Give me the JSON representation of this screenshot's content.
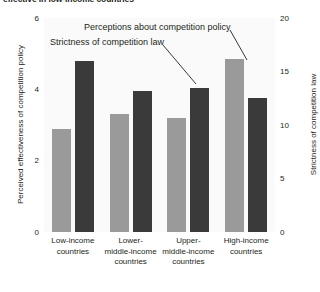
{
  "chart_data": {
    "type": "bar",
    "title": "effective in low-income countries",
    "categories": [
      "Low-income\ncountries",
      "Lower-\nmiddle-income\ncountries",
      "Upper-\nmiddle-income\ncountries",
      "High-income\ncountries"
    ],
    "series": [
      {
        "name": "Perceptions about competition policy",
        "axis": "left",
        "color": "#9a9a9a",
        "values": [
          2.9,
          3.3,
          3.2,
          4.85
        ]
      },
      {
        "name": "Strictness of competition law",
        "axis": "right",
        "color": "#3a3a3a",
        "values": [
          16.0,
          13.2,
          13.5,
          12.5
        ]
      }
    ],
    "xlabel": "",
    "ylabel": "Perceived effectiveness of competition policy",
    "ylabel_right": "Strictness of competition law",
    "ylim": [
      0,
      6
    ],
    "ylim_right": [
      0,
      20
    ],
    "yticks": [
      "6",
      "4",
      "2",
      "0"
    ],
    "ytick_values": [
      6,
      4,
      2,
      0
    ],
    "yticks_right": [
      "20",
      "15",
      "10",
      "5",
      "0"
    ],
    "ytick_values_right": [
      20,
      15,
      10,
      5,
      0
    ],
    "grid": false,
    "legend": "annotations",
    "annotations": [
      "Perceptions about competition policy",
      "Strictness of competition law"
    ]
  },
  "axes": {
    "left_title": "Perceived effectiveness of competition policy",
    "right_title": "Strictness of competition law"
  },
  "annotations": {
    "policy": "Perceptions about competition policy",
    "law": "Strictness of competition law"
  }
}
